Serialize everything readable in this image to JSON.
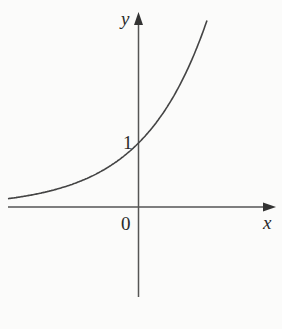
{
  "chart_data": {
    "type": "line",
    "title": "",
    "function": "y = e^x (exponential growth curve)",
    "xlabel": "x",
    "ylabel": "y",
    "annotations": [
      {
        "text": "1",
        "meaning": "y-intercept at (0, 1)"
      },
      {
        "text": "0",
        "meaning": "origin"
      }
    ],
    "x": [
      -2.0,
      -1.5,
      -1.0,
      -0.5,
      0.0,
      0.5,
      1.0
    ],
    "series": [
      {
        "name": "curve",
        "values": [
          0.14,
          0.22,
          0.37,
          0.61,
          1.0,
          1.65,
          2.72
        ]
      }
    ],
    "xlim": [
      -2.0,
      2.0
    ],
    "ylim": [
      -1.4,
      3.0
    ],
    "grid": false,
    "legend": "none"
  },
  "labels": {
    "y_axis": "y",
    "x_axis": "x",
    "intercept": "1",
    "origin": "0"
  },
  "colors": {
    "axis": "#555555",
    "curve": "#444444",
    "background": "#fbfbfa"
  }
}
